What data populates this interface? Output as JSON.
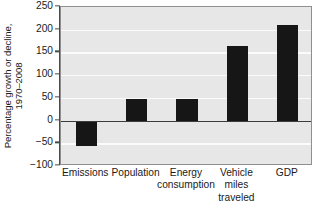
{
  "chart_data": {
    "type": "bar",
    "title": "",
    "xlabel": "",
    "ylabel": "Percentage growth or decline, 1970–2008",
    "ylabel_line1": "Percentage growth or decline,",
    "ylabel_line2": "1970–2008",
    "categories": [
      "Emissions",
      "Population",
      "Energy consumption",
      "Vehicle miles traveled",
      "GDP"
    ],
    "category_lines": [
      [
        "Emissions"
      ],
      [
        "Population"
      ],
      [
        "Energy",
        "consumption"
      ],
      [
        "Vehicle",
        "miles",
        "traveled"
      ],
      [
        "GDP"
      ]
    ],
    "values": [
      -57,
      47,
      47,
      165,
      210
    ],
    "ylim": [
      -100,
      250
    ],
    "ytick_values": [
      250,
      200,
      150,
      100,
      50,
      0,
      -50,
      -100
    ],
    "ytick_labels": [
      "250",
      "200",
      "150",
      "100",
      "50",
      "0",
      "−50",
      "−100"
    ],
    "grid": true,
    "grid_axis": "y",
    "legend": "none",
    "colors": {
      "bar": "#161616",
      "plot_background": "#e7e7e7",
      "gridline": "#fbfbfb",
      "zeroline": "#3c3c3c",
      "axis": "#4a4a4a",
      "text": "#1a1a1a",
      "page_background": "#ffffff"
    }
  }
}
